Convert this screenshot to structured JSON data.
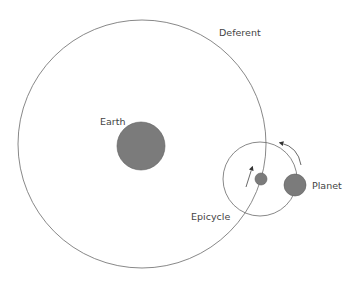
{
  "diagram": {
    "labels": {
      "deferent": "Deferent",
      "earth": "Earth",
      "epicycle": "Epicycle",
      "planet": "Planet"
    },
    "colors": {
      "line": "#6a6a6a",
      "body_fill": "#7b7b7b",
      "body_stroke": "#5e5e5e",
      "text": "#444444",
      "background": "#ffffff"
    },
    "shapes": {
      "deferent": {
        "cx": 142,
        "cy": 144,
        "r": 124
      },
      "earth": {
        "cx": 141,
        "cy": 146,
        "r": 24
      },
      "epicycle": {
        "cx": 260,
        "cy": 179,
        "r": 37
      },
      "epicycle_center": {
        "cx": 261,
        "cy": 179,
        "r": 6
      },
      "planet": {
        "cx": 295,
        "cy": 185,
        "r": 11
      }
    }
  }
}
